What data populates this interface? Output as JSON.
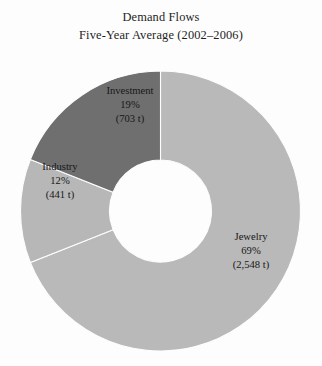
{
  "title": {
    "line1": "Demand Flows",
    "line2": "Five-Year Average (2002–2006)"
  },
  "chart_data": {
    "type": "pie",
    "variant": "donut",
    "title": "Demand Flows Five-Year Average (2002–2006)",
    "subtitle": "Five-Year Average (2002–2006)",
    "unit": "t",
    "total_value": 3692,
    "categories": [
      "Jewelry",
      "Investment",
      "Industry"
    ],
    "values": [
      2548,
      703,
      441
    ],
    "percentages": [
      69,
      19,
      12
    ],
    "value_labels": [
      "(2,548 t)",
      "(703 t)",
      "(441 t)"
    ],
    "percent_labels": [
      "69%",
      "19%",
      "12%"
    ],
    "colors": [
      "#b9b9b9",
      "#6f6f6f",
      "#b7b7b7"
    ],
    "start_angle_deg": 0,
    "direction": "clockwise",
    "legend": "none",
    "grid": false,
    "slices": [
      {
        "name": "Jewelry",
        "percent": 69,
        "percent_label": "69%",
        "value": 2548,
        "value_label": "(2,548 t)",
        "color": "#b9b9b9",
        "start_deg": 0,
        "end_deg": 248.4
      },
      {
        "name": "Industry",
        "percent": 12,
        "percent_label": "12%",
        "value": 441,
        "value_label": "(441 t)",
        "color": "#b7b7b7",
        "start_deg": 248.4,
        "end_deg": 291.6
      },
      {
        "name": "Investment",
        "percent": 19,
        "percent_label": "19%",
        "value": 703,
        "value_label": "(703 t)",
        "color": "#6f6f6f",
        "start_deg": 291.6,
        "end_deg": 360
      }
    ]
  },
  "labels": {
    "investment": {
      "name": "Investment",
      "percent": "19%",
      "value": "(703 t)"
    },
    "industry": {
      "name": "Industry",
      "percent": "12%",
      "value": "(441 t)"
    },
    "jewelry": {
      "name": "Jewelry",
      "percent": "69%",
      "value": "(2,548 t)"
    }
  },
  "style": {
    "background": "#fdfdfd",
    "text_color": "#171717",
    "divider_color": "#fdfdfd"
  }
}
